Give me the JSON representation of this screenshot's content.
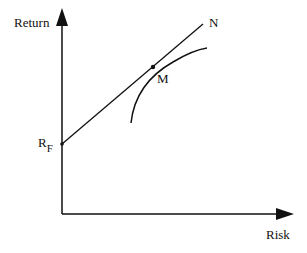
{
  "diagram": {
    "axes": {
      "y_label": "Return",
      "x_label": "Risk"
    },
    "points": {
      "risk_free": {
        "label": "R",
        "subscript": "F"
      },
      "market_portfolio": {
        "label": "M"
      },
      "line_end": {
        "label": "N"
      }
    },
    "elements": [
      "capital-market-line from R_F through M to N",
      "efficient frontier curve tangent at M"
    ],
    "colors": {
      "stroke": "#111111",
      "background": "#ffffff"
    }
  }
}
